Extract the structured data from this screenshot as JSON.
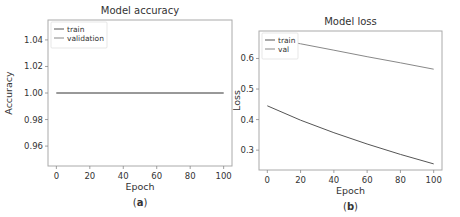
{
  "chart_data": [
    {
      "type": "line",
      "panel_label": "a",
      "title": "Model accuracy",
      "xlabel": "Epoch",
      "ylabel": "Accuracy",
      "xlim": [
        -5,
        105
      ],
      "ylim": [
        0.945,
        1.055
      ],
      "xticks": [
        0,
        20,
        40,
        60,
        80,
        100
      ],
      "yticks": [
        0.96,
        0.98,
        1.0,
        1.02,
        1.04
      ],
      "ytick_labels": [
        "0.96",
        "0.98",
        "1.00",
        "1.02",
        "1.04"
      ],
      "legend": [
        "train",
        "validation"
      ],
      "legend_position": "upper left",
      "grid": false,
      "series": [
        {
          "name": "train",
          "x": [
            0,
            100
          ],
          "values": [
            1.0,
            1.0
          ],
          "color": "#555555"
        },
        {
          "name": "validation",
          "x": [
            0,
            100
          ],
          "values": [
            1.0,
            1.0
          ],
          "color": "#888888"
        }
      ]
    },
    {
      "type": "line",
      "panel_label": "b",
      "title": "Model loss",
      "xlabel": "Epoch",
      "ylabel": "Loss",
      "xlim": [
        -5,
        105
      ],
      "ylim": [
        0.235,
        0.69
      ],
      "xticks": [
        0,
        20,
        40,
        60,
        80,
        100
      ],
      "yticks": [
        0.3,
        0.4,
        0.5,
        0.6
      ],
      "ytick_labels": [
        "0.3",
        "0.4",
        "0.5",
        "0.6"
      ],
      "legend": [
        "train",
        "val"
      ],
      "legend_position": "upper left",
      "grid": false,
      "series": [
        {
          "name": "train",
          "x": [
            0,
            20,
            40,
            60,
            80,
            100
          ],
          "values": [
            0.445,
            0.398,
            0.357,
            0.32,
            0.286,
            0.255
          ],
          "color": "#555555"
        },
        {
          "name": "val",
          "x": [
            0,
            20,
            40,
            60,
            80,
            100
          ],
          "values": [
            0.668,
            0.648,
            0.627,
            0.606,
            0.586,
            0.565
          ],
          "color": "#888888"
        }
      ]
    }
  ]
}
